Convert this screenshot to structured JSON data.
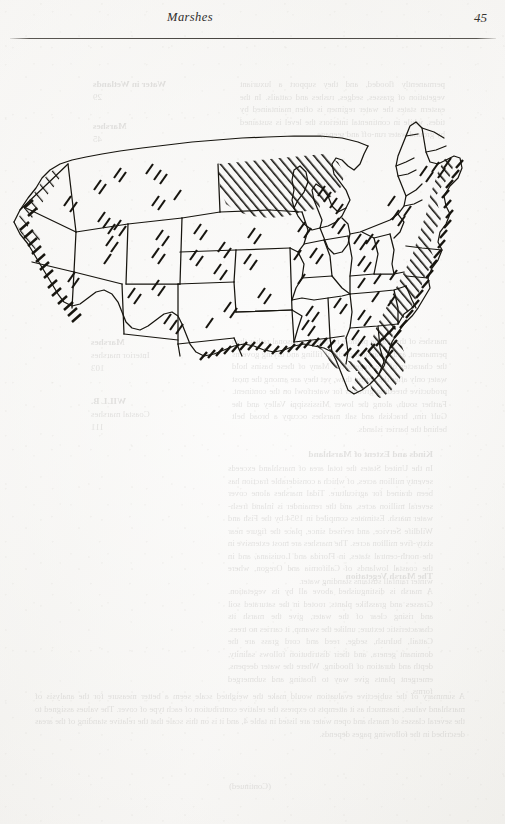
{
  "page": {
    "width": 505,
    "height": 824,
    "paper_color": "#f6f5f3",
    "ink_color": "#1d1b19"
  },
  "running_head": {
    "title": "Marshes",
    "folio": "45"
  },
  "figure": {
    "name": "us-marsh-distribution-map",
    "hatch_legend": "diagonal-line shading = marsh distribution",
    "regions_heavily_hatched": [
      "North Dakota",
      "South Dakota",
      "Minnesota",
      "Gulf Coast of Texas and Louisiana",
      "Florida",
      "Atlantic Coast from Georgia to Maine",
      "Chesapeake Bay",
      "Pacific Coast of California, Oregon and Washington",
      "Great Salt Lake basin"
    ],
    "regions_lightly_hatched": [
      "Utah",
      "Colorado",
      "New Mexico",
      "Nebraska",
      "Kansas",
      "Iowa",
      "Illinois",
      "Indiana",
      "Ohio",
      "Michigan",
      "Wisconsin",
      "Alabama",
      "Mississippi",
      "Arkansas",
      "Tennessee",
      "Kentucky",
      "Missouri",
      "Nevada",
      "Idaho",
      "Montana",
      "Wyoming",
      "Arizona",
      "Oregon",
      "Washington"
    ]
  },
  "bleedthrough": {
    "note": "Faint mirrored text from the reverse of the leaf, showing through the paper.",
    "left_column_top": "permanently flooded, and they support a luxuriant vegetation of grasses, sedges, rushes and cattails. In the eastern states the water regimen is often maintained by tides, while in continental interiors the level is sustained by ground water run-off and seepage.",
    "right_column_top_head": "Water in Wetlands",
    "right_column_top_num": "29",
    "right_column_second_head": "Marshes",
    "right_column_second_num": "45",
    "left_column_middle": "marshes of the prairie pothole region are seasonal rather than permanent, and the annual cycle of filling and drying governs the character of the vegetation. Many of these basins hold water only after the spring thaw, yet they are among the most productive breeding grounds for waterfowl on the continent. Farther south, along the lower Mississippi Valley and the Gulf rim, brackish and salt marshes occupy a broad belt behind the barrier islands.",
    "left_column_lower_head": "Kinds and Extent of Marshland",
    "left_column_lower": "In the United States the total area of marshland exceeds seventy million acres, of which a considerable fraction has been drained for agriculture. Tidal marshes alone cover several million acres, and the remainder is inland fresh-water marsh. Estimates compiled in 1954 by the Fish and Wildlife Service, and revised since, place the figure near sixty-five million acres. The marshes are most extensive in the north-central states, in Florida and Louisiana, and in the coastal lowlands of California and Oregon, where winter rainfall sustains standing water.",
    "left_column_bottom_head": "The Marsh Vegetation",
    "left_column_bottom": "A marsh is distinguished above all by its vegetation. Grasses and grasslike plants, rooted in the saturated soil and rising clear of the water, give the marsh its characteristic texture; unlike the swamp, it carries no trees. Cattail, bulrush, sedge, reed and cord grass are the dominant genera, and their distribution follows salinity, depth and duration of flooding. Where the water deepens, emergent plants give way to floating and submerged forms.",
    "right_column_third_head": "Marshes",
    "right_column_third_sub": "Interior marshes",
    "right_column_third_num": "103",
    "right_column_fourth_head": "WILL B.",
    "right_column_fourth_sub": "Coastal marshes",
    "right_column_fourth_num": "111",
    "bottom_left": "A summary of the subjective evaluation would make the weighted scale seem a better measure for the analysis of marshland values, inasmuch as it attempts to express the relative contribution of each type of cover. The values assigned to the several classes of marsh and open water are listed in table 4, and it is on this scale that the relative standing of the areas described in the following pages depends.",
    "bottom_center": "(Continued)"
  }
}
